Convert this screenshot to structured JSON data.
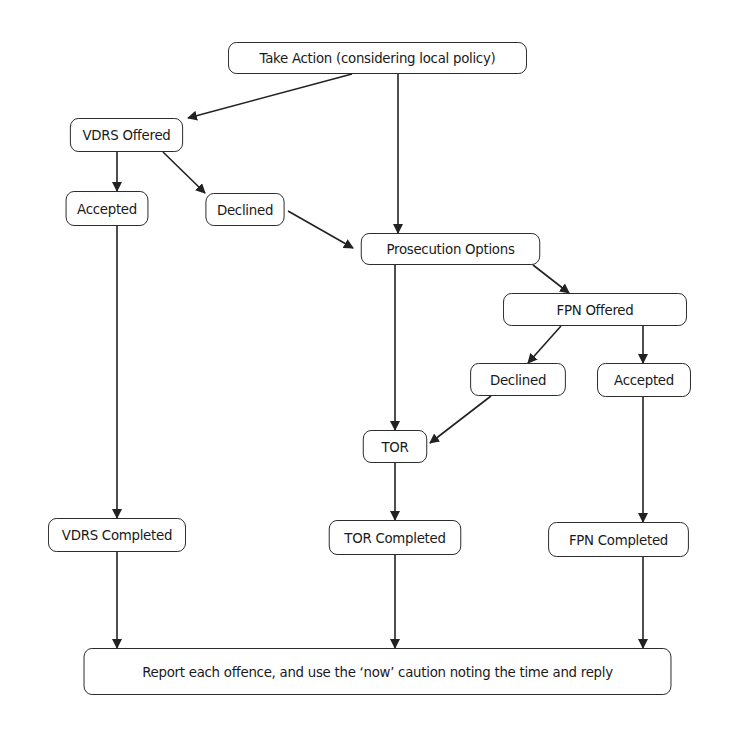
{
  "diagram": {
    "type": "flowchart",
    "stroke_color": "#222222",
    "background": "#ffffff",
    "nodes": {
      "take_action": {
        "label": "Take Action (considering local policy)",
        "box": [
          215,
          42,
          325,
          32
        ]
      },
      "vdrs_offered": {
        "label": "VDRS Offered",
        "box": [
          65,
          118,
          123,
          34
        ]
      },
      "vdrs_accepted": {
        "label": "Accepted",
        "box": [
          62,
          191,
          90,
          35
        ]
      },
      "vdrs_declined": {
        "label": "Declined",
        "box": [
          202,
          193,
          86,
          33
        ]
      },
      "prosecution_options": {
        "label": "Prosecution Options",
        "box": [
          353,
          233,
          195,
          32
        ]
      },
      "fpn_offered": {
        "label": "FPN Offered",
        "box": [
          495,
          293,
          200,
          33
        ]
      },
      "fpn_declined": {
        "label": "Declined",
        "box": [
          466,
          363,
          104,
          33
        ]
      },
      "fpn_accepted": {
        "label": "Accepted",
        "box": [
          593,
          363,
          102,
          34
        ]
      },
      "tor": {
        "label": "TOR",
        "box": [
          360,
          430,
          70,
          33
        ]
      },
      "vdrs_completed": {
        "label": "VDRS Completed",
        "box": [
          42,
          518,
          150,
          34
        ]
      },
      "tor_completed": {
        "label": "TOR Completed",
        "box": [
          323,
          520,
          144,
          35
        ]
      },
      "fpn_completed": {
        "label": "FPN Completed",
        "box": [
          542,
          522,
          153,
          35
        ]
      },
      "report": {
        "label": "Report each offence, and use the ‘now’ caution noting the time and reply",
        "box": [
          58,
          648,
          639,
          47
        ]
      }
    },
    "edges": [
      {
        "from": "take_action",
        "to": "vdrs_offered",
        "points": [
          [
            352,
            74
          ],
          [
            188,
            118
          ]
        ]
      },
      {
        "from": "take_action",
        "to": "prosecution_options",
        "points": [
          [
            398,
            74
          ],
          [
            398,
            233
          ]
        ]
      },
      {
        "from": "vdrs_offered",
        "to": "vdrs_accepted",
        "points": [
          [
            117,
            152
          ],
          [
            117,
            191
          ]
        ]
      },
      {
        "from": "vdrs_offered",
        "to": "vdrs_declined",
        "points": [
          [
            163,
            152
          ],
          [
            205,
            193
          ]
        ]
      },
      {
        "from": "vdrs_declined",
        "to": "prosecution_options",
        "points": [
          [
            288,
            211
          ],
          [
            353,
            248
          ]
        ]
      },
      {
        "from": "prosecution_options",
        "to": "fpn_offered",
        "points": [
          [
            533,
            265
          ],
          [
            569,
            293
          ]
        ]
      },
      {
        "from": "prosecution_options",
        "to": "tor",
        "points": [
          [
            395,
            265
          ],
          [
            395,
            430
          ]
        ]
      },
      {
        "from": "fpn_offered",
        "to": "fpn_declined",
        "points": [
          [
            561,
            326
          ],
          [
            528,
            363
          ]
        ]
      },
      {
        "from": "fpn_offered",
        "to": "fpn_accepted",
        "points": [
          [
            643,
            326
          ],
          [
            643,
            363
          ]
        ]
      },
      {
        "from": "fpn_declined",
        "to": "tor",
        "points": [
          [
            491,
            396
          ],
          [
            430,
            443
          ]
        ]
      },
      {
        "from": "vdrs_accepted",
        "to": "vdrs_completed",
        "points": [
          [
            117,
            226
          ],
          [
            117,
            518
          ]
        ]
      },
      {
        "from": "tor",
        "to": "tor_completed",
        "points": [
          [
            395,
            463
          ],
          [
            395,
            520
          ]
        ]
      },
      {
        "from": "fpn_accepted",
        "to": "fpn_completed",
        "points": [
          [
            643,
            397
          ],
          [
            643,
            522
          ]
        ]
      },
      {
        "from": "vdrs_completed",
        "to": "report",
        "points": [
          [
            117,
            552
          ],
          [
            117,
            648
          ]
        ]
      },
      {
        "from": "tor_completed",
        "to": "report",
        "points": [
          [
            395,
            555
          ],
          [
            395,
            648
          ]
        ]
      },
      {
        "from": "fpn_completed",
        "to": "report",
        "points": [
          [
            643,
            557
          ],
          [
            643,
            648
          ]
        ]
      }
    ]
  }
}
